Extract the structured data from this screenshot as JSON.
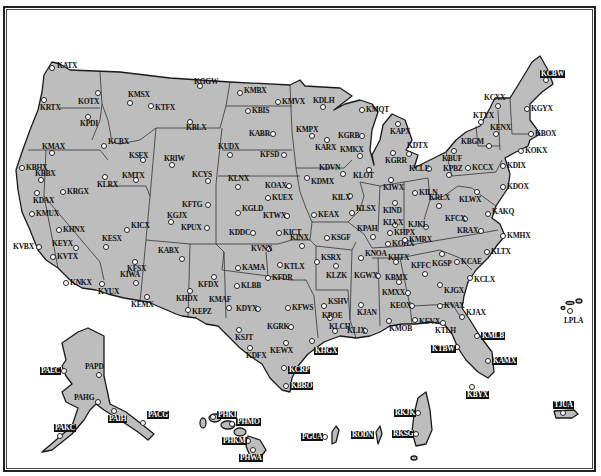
{
  "map": {
    "title": "NEXRAD WSR-88D Radar Sites",
    "colors": {
      "land": "#bdbdbd",
      "outline": "#1a1a1a",
      "background": "#ffffff",
      "marker": "#ffffff"
    }
  },
  "stations": [
    {
      "id": "KATX",
      "x": 52,
      "y": 68,
      "lx": 5,
      "ly": -6
    },
    {
      "id": "KRTX",
      "x": 44,
      "y": 100,
      "lx": -4,
      "ly": 4
    },
    {
      "id": "KOTX",
      "x": 98,
      "y": 93,
      "lx": -20,
      "ly": 5
    },
    {
      "id": "KPDI",
      "x": 88,
      "y": 117,
      "lx": -8,
      "ly": 3
    },
    {
      "id": "KCBX",
      "x": 104,
      "y": 146,
      "lx": 4,
      "ly": -8
    },
    {
      "id": "KMSX",
      "x": 130,
      "y": 103,
      "lx": -2,
      "ly": -12
    },
    {
      "id": "KTFX",
      "x": 151,
      "y": 106,
      "lx": 4,
      "ly": -2
    },
    {
      "id": "KGGW",
      "x": 200,
      "y": 86,
      "lx": -6,
      "ly": -8
    },
    {
      "id": "KBLX",
      "x": 190,
      "y": 122,
      "lx": -4,
      "ly": 2
    },
    {
      "id": "KMBX",
      "x": 240,
      "y": 93,
      "lx": 4,
      "ly": -6
    },
    {
      "id": "KBIS",
      "x": 248,
      "y": 111,
      "lx": 4,
      "ly": -4
    },
    {
      "id": "KMVX",
      "x": 278,
      "y": 102,
      "lx": 4,
      "ly": -4
    },
    {
      "id": "KDLH",
      "x": 323,
      "y": 107,
      "lx": -10,
      "ly": -10
    },
    {
      "id": "KMAX",
      "x": 52,
      "y": 153,
      "lx": -10,
      "ly": -10
    },
    {
      "id": "KBHX",
      "x": 22,
      "y": 168,
      "lx": 4,
      "ly": -4
    },
    {
      "id": "KBBX",
      "x": 41,
      "y": 180,
      "lx": -6,
      "ly": -10
    },
    {
      "id": "KDAX",
      "x": 37,
      "y": 193,
      "lx": -4,
      "ly": 4
    },
    {
      "id": "KMUX",
      "x": 32,
      "y": 214,
      "lx": 4,
      "ly": -4
    },
    {
      "id": "KHNX",
      "x": 59,
      "y": 230,
      "lx": 4,
      "ly": -4
    },
    {
      "id": "KVBX",
      "x": 39,
      "y": 247,
      "lx": -26,
      "ly": -4
    },
    {
      "id": "KEYX",
      "x": 76,
      "y": 248,
      "lx": -24,
      "ly": -8
    },
    {
      "id": "KVTX",
      "x": 53,
      "y": 257,
      "lx": 4,
      "ly": -4
    },
    {
      "id": "KNKX",
      "x": 66,
      "y": 283,
      "lx": 4,
      "ly": -4
    },
    {
      "id": "KRGX",
      "x": 63,
      "y": 192,
      "lx": 4,
      "ly": -4
    },
    {
      "id": "KLRX",
      "x": 105,
      "y": 177,
      "lx": -8,
      "ly": 4
    },
    {
      "id": "KSFX",
      "x": 143,
      "y": 160,
      "lx": -14,
      "ly": -8
    },
    {
      "id": "KMTX",
      "x": 136,
      "y": 180,
      "lx": -14,
      "ly": -8
    },
    {
      "id": "KRIW",
      "x": 172,
      "y": 165,
      "lx": -8,
      "ly": -10
    },
    {
      "id": "KCYS",
      "x": 208,
      "y": 181,
      "lx": -16,
      "ly": -10
    },
    {
      "id": "KUDX",
      "x": 230,
      "y": 155,
      "lx": -12,
      "ly": -12
    },
    {
      "id": "KABR",
      "x": 273,
      "y": 134,
      "lx": -24,
      "ly": -4
    },
    {
      "id": "KFSD",
      "x": 284,
      "y": 155,
      "lx": -24,
      "ly": -4
    },
    {
      "id": "KMPX",
      "x": 312,
      "y": 136,
      "lx": -16,
      "ly": -10
    },
    {
      "id": "KARX",
      "x": 327,
      "y": 140,
      "lx": -12,
      "ly": 4
    },
    {
      "id": "KGRB",
      "x": 362,
      "y": 136,
      "lx": -24,
      "ly": -4
    },
    {
      "id": "KMKX",
      "x": 360,
      "y": 156,
      "lx": -20,
      "ly": -10
    },
    {
      "id": "KMQT",
      "x": 362,
      "y": 110,
      "lx": 4,
      "ly": -4
    },
    {
      "id": "KLNX",
      "x": 238,
      "y": 187,
      "lx": -10,
      "ly": -12
    },
    {
      "id": "KOAX",
      "x": 289,
      "y": 186,
      "lx": -24,
      "ly": -4
    },
    {
      "id": "KUEX",
      "x": 268,
      "y": 198,
      "lx": 4,
      "ly": -4
    },
    {
      "id": "KDVN",
      "x": 343,
      "y": 174,
      "lx": -24,
      "ly": -10
    },
    {
      "id": "KDMX",
      "x": 307,
      "y": 178,
      "lx": 4,
      "ly": 0
    },
    {
      "id": "KLOT",
      "x": 369,
      "y": 170,
      "lx": -16,
      "ly": 2
    },
    {
      "id": "KFTG",
      "x": 208,
      "y": 205,
      "lx": -26,
      "ly": -4
    },
    {
      "id": "KGJX",
      "x": 171,
      "y": 222,
      "lx": -4,
      "ly": -10
    },
    {
      "id": "KPUX",
      "x": 207,
      "y": 228,
      "lx": -26,
      "ly": -4
    },
    {
      "id": "KGLD",
      "x": 238,
      "y": 213,
      "lx": 4,
      "ly": -8
    },
    {
      "id": "KTWX",
      "x": 287,
      "y": 216,
      "lx": -24,
      "ly": -4
    },
    {
      "id": "KEAX",
      "x": 314,
      "y": 215,
      "lx": 4,
      "ly": -4
    },
    {
      "id": "KDDC",
      "x": 253,
      "y": 233,
      "lx": -24,
      "ly": -4
    },
    {
      "id": "KICT",
      "x": 279,
      "y": 233,
      "lx": 4,
      "ly": -4
    },
    {
      "id": "KILX",
      "x": 350,
      "y": 196,
      "lx": -18,
      "ly": -2
    },
    {
      "id": "KLSX",
      "x": 352,
      "y": 213,
      "lx": 4,
      "ly": -8
    },
    {
      "id": "KSGF",
      "x": 327,
      "y": 238,
      "lx": 4,
      "ly": -4
    },
    {
      "id": "KPAH",
      "x": 373,
      "y": 237,
      "lx": -16,
      "ly": -12
    },
    {
      "id": "KESX",
      "x": 106,
      "y": 247,
      "lx": -4,
      "ly": -12
    },
    {
      "id": "KICX",
      "x": 127,
      "y": 230,
      "lx": 4,
      "ly": -8
    },
    {
      "id": "KFSX",
      "x": 135,
      "y": 262,
      "lx": -8,
      "ly": 3
    },
    {
      "id": "KIWA",
      "x": 136,
      "y": 283,
      "lx": -16,
      "ly": -12
    },
    {
      "id": "KYUX",
      "x": 102,
      "y": 284,
      "lx": -4,
      "ly": 4
    },
    {
      "id": "KEMX",
      "x": 147,
      "y": 297,
      "lx": -16,
      "ly": 4
    },
    {
      "id": "KABX",
      "x": 182,
      "y": 259,
      "lx": -24,
      "ly": -12
    },
    {
      "id": "KFDX",
      "x": 214,
      "y": 277,
      "lx": -16,
      "ly": 4
    },
    {
      "id": "KHDX",
      "x": 190,
      "y": 291,
      "lx": -14,
      "ly": 4
    },
    {
      "id": "KEPZ",
      "x": 188,
      "y": 310,
      "lx": 4,
      "ly": -2
    },
    {
      "id": "KVNX",
      "x": 269,
      "y": 249,
      "lx": -18,
      "ly": -4
    },
    {
      "id": "KINX",
      "x": 302,
      "y": 246,
      "lx": -12,
      "ly": -12
    },
    {
      "id": "KAMA",
      "x": 238,
      "y": 268,
      "lx": 4,
      "ly": -4
    },
    {
      "id": "KTLX",
      "x": 280,
      "y": 265,
      "lx": 4,
      "ly": -2
    },
    {
      "id": "KFDR",
      "x": 268,
      "y": 278,
      "lx": 4,
      "ly": -4
    },
    {
      "id": "KLBB",
      "x": 237,
      "y": 286,
      "lx": 4,
      "ly": -4
    },
    {
      "id": "KSRX",
      "x": 317,
      "y": 262,
      "lx": 4,
      "ly": -8
    },
    {
      "id": "KLZK",
      "x": 336,
      "y": 266,
      "lx": -10,
      "ly": 6
    },
    {
      "id": "KNOA",
      "x": 361,
      "y": 258,
      "lx": 4,
      "ly": -8
    },
    {
      "id": "KMAF",
      "x": 229,
      "y": 308,
      "lx": -20,
      "ly": -12
    },
    {
      "id": "KDYX",
      "x": 258,
      "y": 309,
      "lx": -22,
      "ly": -4
    },
    {
      "id": "KFWS",
      "x": 288,
      "y": 308,
      "lx": 4,
      "ly": -4
    },
    {
      "id": "KSJT",
      "x": 239,
      "y": 330,
      "lx": -4,
      "ly": 4
    },
    {
      "id": "KGRK",
      "x": 291,
      "y": 327,
      "lx": -24,
      "ly": -4
    },
    {
      "id": "KEWX",
      "x": 286,
      "y": 343,
      "lx": -16,
      "ly": 4
    },
    {
      "id": "KDFX",
      "x": 250,
      "y": 348,
      "lx": -4,
      "ly": 4
    },
    {
      "id": "KHGX",
      "x": 312,
      "y": 341,
      "lx": 2,
      "ly": 6,
      "hl": true
    },
    {
      "id": "KCRP",
      "x": 284,
      "y": 368,
      "lx": 4,
      "ly": -2,
      "hl": true
    },
    {
      "id": "KBRO",
      "x": 286,
      "y": 386,
      "lx": 4,
      "ly": -4,
      "hl": true
    },
    {
      "id": "KSHV",
      "x": 324,
      "y": 306,
      "lx": 4,
      "ly": -8
    },
    {
      "id": "KPOE",
      "x": 330,
      "y": 318,
      "lx": -8,
      "ly": -6
    },
    {
      "id": "KLCH",
      "x": 335,
      "y": 331,
      "lx": -6,
      "ly": -8
    },
    {
      "id": "KLIX",
      "x": 365,
      "y": 331,
      "lx": -18,
      "ly": -4
    },
    {
      "id": "KJAN",
      "x": 361,
      "y": 305,
      "lx": -4,
      "ly": 4
    },
    {
      "id": "KGWX",
      "x": 378,
      "y": 276,
      "lx": -24,
      "ly": -4
    },
    {
      "id": "KHTX",
      "x": 396,
      "y": 262,
      "lx": -8,
      "ly": -8
    },
    {
      "id": "KBMX",
      "x": 399,
      "y": 282,
      "lx": -14,
      "ly": -8
    },
    {
      "id": "KMXX",
      "x": 408,
      "y": 293,
      "lx": -26,
      "ly": -4
    },
    {
      "id": "KEOX",
      "x": 412,
      "y": 306,
      "lx": -22,
      "ly": -4
    },
    {
      "id": "KMOB",
      "x": 389,
      "y": 321,
      "lx": 0,
      "ly": 4
    },
    {
      "id": "KEVX",
      "x": 415,
      "y": 320,
      "lx": 4,
      "ly": -2
    },
    {
      "id": "KTLH",
      "x": 443,
      "y": 323,
      "lx": -8,
      "ly": 4
    },
    {
      "id": "KJAX",
      "x": 462,
      "y": 317,
      "lx": 4,
      "ly": -8
    },
    {
      "id": "KVAX",
      "x": 440,
      "y": 306,
      "lx": 4,
      "ly": -4
    },
    {
      "id": "KJGX",
      "x": 440,
      "y": 285,
      "lx": 4,
      "ly": 2
    },
    {
      "id": "KFFC",
      "x": 425,
      "y": 274,
      "lx": -14,
      "ly": -12
    },
    {
      "id": "KGSP",
      "x": 442,
      "y": 254,
      "lx": -10,
      "ly": 6
    },
    {
      "id": "KCAE",
      "x": 457,
      "y": 262,
      "lx": 4,
      "ly": -4
    },
    {
      "id": "KCLX",
      "x": 470,
      "y": 278,
      "lx": 4,
      "ly": -2
    },
    {
      "id": "KMLB",
      "x": 477,
      "y": 336,
      "lx": 4,
      "ly": -4,
      "hl": true
    },
    {
      "id": "KTBW",
      "x": 457,
      "y": 347,
      "lx": -26,
      "ly": -2,
      "hl": true
    },
    {
      "id": "KAMX",
      "x": 488,
      "y": 361,
      "lx": 4,
      "ly": -4,
      "hl": true
    },
    {
      "id": "KBYX",
      "x": 472,
      "y": 387,
      "lx": -6,
      "ly": 4,
      "hl": true
    },
    {
      "id": "KOHX",
      "x": 388,
      "y": 244,
      "lx": 4,
      "ly": -4
    },
    {
      "id": "KMRX",
      "x": 405,
      "y": 240,
      "lx": 4,
      "ly": -4
    },
    {
      "id": "KHPX",
      "x": 390,
      "y": 233,
      "lx": 4,
      "ly": -4
    },
    {
      "id": "KRAX",
      "x": 481,
      "y": 231,
      "lx": -24,
      "ly": -4
    },
    {
      "id": "KLTX",
      "x": 487,
      "y": 252,
      "lx": 4,
      "ly": -4
    },
    {
      "id": "KMHX",
      "x": 503,
      "y": 236,
      "lx": 4,
      "ly": -4
    },
    {
      "id": "KAKQ",
      "x": 488,
      "y": 214,
      "lx": 4,
      "ly": -6
    },
    {
      "id": "KFCX",
      "x": 465,
      "y": 219,
      "lx": -20,
      "ly": -4
    },
    {
      "id": "KJKL",
      "x": 426,
      "y": 227,
      "lx": -18,
      "ly": -6
    },
    {
      "id": "KLVX",
      "x": 395,
      "y": 225,
      "lx": -12,
      "ly": -6
    },
    {
      "id": "KIND",
      "x": 395,
      "y": 203,
      "lx": -12,
      "ly": 4
    },
    {
      "id": "KIWX",
      "x": 391,
      "y": 180,
      "lx": -8,
      "ly": 4
    },
    {
      "id": "KILN",
      "x": 415,
      "y": 193,
      "lx": 4,
      "ly": -4
    },
    {
      "id": "KRLX",
      "x": 439,
      "y": 206,
      "lx": -10,
      "ly": -12
    },
    {
      "id": "KLWX",
      "x": 477,
      "y": 192,
      "lx": -18,
      "ly": 4
    },
    {
      "id": "KGRR",
      "x": 393,
      "y": 153,
      "lx": -8,
      "ly": 4
    },
    {
      "id": "KAPX",
      "x": 398,
      "y": 124,
      "lx": -8,
      "ly": 4
    },
    {
      "id": "KDTX",
      "x": 409,
      "y": 154,
      "lx": -2,
      "ly": -12
    },
    {
      "id": "KCLE",
      "x": 429,
      "y": 169,
      "lx": -20,
      "ly": -4
    },
    {
      "id": "KPBZ",
      "x": 449,
      "y": 175,
      "lx": -6,
      "ly": -10
    },
    {
      "id": "KCCX",
      "x": 468,
      "y": 168,
      "lx": 4,
      "ly": -4
    },
    {
      "id": "KBUF",
      "x": 454,
      "y": 151,
      "lx": -12,
      "ly": 4
    },
    {
      "id": "KBGM",
      "x": 489,
      "y": 146,
      "lx": -28,
      "ly": -8
    },
    {
      "id": "KTYX",
      "x": 481,
      "y": 122,
      "lx": -8,
      "ly": -10
    },
    {
      "id": "KCXX",
      "x": 498,
      "y": 106,
      "lx": -14,
      "ly": -12
    },
    {
      "id": "KENX",
      "x": 496,
      "y": 134,
      "lx": -6,
      "ly": -10
    },
    {
      "id": "KDIX",
      "x": 503,
      "y": 166,
      "lx": 4,
      "ly": -4
    },
    {
      "id": "KDOX",
      "x": 503,
      "y": 187,
      "lx": 4,
      "ly": -4
    },
    {
      "id": "KOKX",
      "x": 521,
      "y": 151,
      "lx": 4,
      "ly": -4
    },
    {
      "id": "KBOX",
      "x": 531,
      "y": 134,
      "lx": 4,
      "ly": -4
    },
    {
      "id": "KGYX",
      "x": 527,
      "y": 109,
      "lx": 4,
      "ly": -4
    },
    {
      "id": "KCBW",
      "x": 546,
      "y": 80,
      "lx": -6,
      "ly": -10,
      "hl": true
    },
    {
      "id": "LPLA",
      "x": 570,
      "y": 311,
      "lx": -6,
      "ly": 6
    },
    {
      "id": "PAPD",
      "x": 99,
      "y": 375,
      "lx": -14,
      "ly": -12
    },
    {
      "id": "PAEC",
      "x": 64,
      "y": 371,
      "lx": -24,
      "ly": -4,
      "hl": true
    },
    {
      "id": "PAHG",
      "x": 98,
      "y": 402,
      "lx": -24,
      "ly": -8
    },
    {
      "id": "PAIH",
      "x": 114,
      "y": 411,
      "lx": -6,
      "ly": 4,
      "hl": true
    },
    {
      "id": "PACG",
      "x": 143,
      "y": 423,
      "lx": 4,
      "ly": -12,
      "hl": true
    },
    {
      "id": "PAKC",
      "x": 60,
      "y": 436,
      "lx": -6,
      "ly": -12,
      "hl": true
    },
    {
      "id": "PHKI",
      "x": 213,
      "y": 417,
      "lx": 4,
      "ly": -6,
      "hl": true
    },
    {
      "id": "PHMO",
      "x": 232,
      "y": 424,
      "lx": 4,
      "ly": -6,
      "hl": true
    },
    {
      "id": "PHKM",
      "x": 248,
      "y": 441,
      "lx": -26,
      "ly": -4,
      "hl": true
    },
    {
      "id": "PHWA",
      "x": 253,
      "y": 450,
      "lx": -14,
      "ly": 4,
      "hl": true
    },
    {
      "id": "PGUA",
      "x": 325,
      "y": 437,
      "lx": -24,
      "ly": -4,
      "hl": true
    },
    {
      "id": "RODN",
      "x": 371,
      "y": 435,
      "lx": -20,
      "ly": -4,
      "hl": true
    },
    {
      "id": "RKJK",
      "x": 418,
      "y": 413,
      "lx": -24,
      "ly": -4,
      "hl": true
    },
    {
      "id": "RKSG",
      "x": 416,
      "y": 434,
      "lx": -24,
      "ly": -4,
      "hl": true
    },
    {
      "id": "KBYX2",
      "x": 0,
      "y": 0,
      "hidden": true
    },
    {
      "id": "TJUA",
      "x": 563,
      "y": 413,
      "lx": -10,
      "ly": -12,
      "hl": true
    }
  ]
}
